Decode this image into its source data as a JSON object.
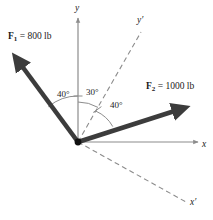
{
  "figure": {
    "type": "free-body-force-diagram",
    "background_color": "#ffffff",
    "vector_color": "#3c3c3c",
    "axis_color": "#8c8c8c",
    "text_color": "#1a1a1a",
    "origin": {
      "x": 78,
      "y": 142
    }
  },
  "forces": [
    {
      "name": "F1",
      "symbol": "F",
      "subscript": "1",
      "label": "F₁ = 800 lb",
      "label_prefix": "F",
      "label_suffix": " = 800 lb",
      "magnitude": 800,
      "unit": "lb",
      "tip": {
        "x": 13,
        "y": 55
      },
      "direction_deg_from_y_axis": 40,
      "direction": "upper-left"
    },
    {
      "name": "F2",
      "symbol": "F",
      "subscript": "2",
      "label": "F₂ = 1000 lb",
      "label_prefix": "F",
      "label_suffix": " = 1000 lb",
      "magnitude": 1000,
      "unit": "lb",
      "tip": {
        "x": 188,
        "y": 105
      },
      "direction_deg_from_yprime_axis": 40,
      "direction": "upper-right"
    }
  ],
  "angles": [
    {
      "name": "angle-f1-to-y",
      "label": "40°",
      "value": 40,
      "between": [
        "F1",
        "y"
      ]
    },
    {
      "name": "angle-y-to-yprime",
      "label": "30°",
      "value": 30,
      "between": [
        "y",
        "y'"
      ]
    },
    {
      "name": "angle-yprime-to-f2",
      "label": "40°",
      "value": 40,
      "between": [
        "y'",
        "F2"
      ]
    }
  ],
  "axes": [
    {
      "name": "y-axis",
      "label": "y",
      "style": "solid",
      "direction": "up"
    },
    {
      "name": "x-axis",
      "label": "x",
      "style": "solid",
      "direction": "right"
    },
    {
      "name": "y-prime-axis",
      "label": "y′",
      "style": "dashed",
      "direction": "upper-right",
      "tilt_deg": 30
    },
    {
      "name": "x-prime-axis",
      "label": "x′",
      "style": "dashed",
      "direction": "lower-right",
      "tilt_deg": 30
    }
  ]
}
